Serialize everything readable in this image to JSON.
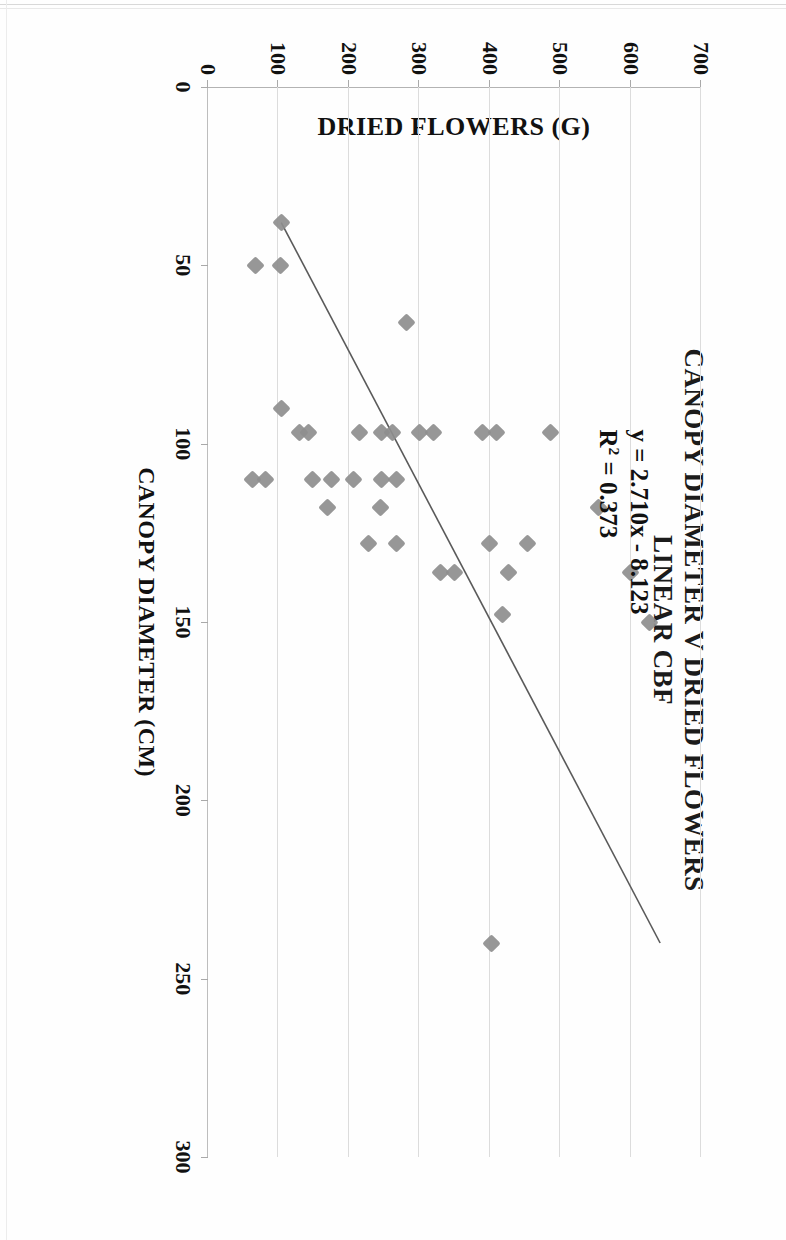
{
  "chart_data": {
    "type": "scatter",
    "title": "CANOPY DIAMETER V DRIED FLOWERS",
    "subtitle": "LINEAR CBF",
    "xlabel": "CANOPY DIAMETER (CM)",
    "ylabel": "DRIED FLOWERS (G)",
    "xlim": [
      0,
      300
    ],
    "ylim": [
      0,
      700
    ],
    "xticks": [
      "0",
      "50",
      "100",
      "150",
      "200",
      "250",
      "300"
    ],
    "yticks": [
      "0",
      "100",
      "200",
      "300",
      "400",
      "500",
      "600",
      "700"
    ],
    "xtick_values": [
      0,
      50,
      100,
      150,
      200,
      250,
      300
    ],
    "ytick_values": [
      0,
      100,
      200,
      300,
      400,
      500,
      600,
      700
    ],
    "grid": "y-gridlines-only",
    "legend": "none",
    "marker_shape": "diamond",
    "marker_color": "#8e8e8e",
    "trendline_color": "#5a5a5a",
    "annotation": {
      "equation": "y = 2.710x - 8.123",
      "r_squared": "R² = 0.373",
      "r_squared_prefix": "R",
      "r_squared_sup": "2",
      "r_squared_rest": " = 0.373",
      "slope": 2.71,
      "intercept": -8.123,
      "r2_value": 0.373
    },
    "trendline": {
      "x_start": 38,
      "y_start": 104,
      "x_end": 240,
      "y_end": 642
    },
    "points": [
      {
        "x": 38,
        "y": 105
      },
      {
        "x": 50,
        "y": 103
      },
      {
        "x": 50,
        "y": 68
      },
      {
        "x": 66,
        "y": 282
      },
      {
        "x": 90,
        "y": 105
      },
      {
        "x": 97,
        "y": 130
      },
      {
        "x": 97,
        "y": 143
      },
      {
        "x": 97,
        "y": 215
      },
      {
        "x": 97,
        "y": 247
      },
      {
        "x": 97,
        "y": 262
      },
      {
        "x": 97,
        "y": 300
      },
      {
        "x": 97,
        "y": 320
      },
      {
        "x": 97,
        "y": 390
      },
      {
        "x": 97,
        "y": 410
      },
      {
        "x": 97,
        "y": 487
      },
      {
        "x": 110,
        "y": 63
      },
      {
        "x": 110,
        "y": 82
      },
      {
        "x": 110,
        "y": 148
      },
      {
        "x": 110,
        "y": 176
      },
      {
        "x": 110,
        "y": 207
      },
      {
        "x": 110,
        "y": 246
      },
      {
        "x": 110,
        "y": 268
      },
      {
        "x": 118,
        "y": 170
      },
      {
        "x": 118,
        "y": 245
      },
      {
        "x": 118,
        "y": 555
      },
      {
        "x": 128,
        "y": 228
      },
      {
        "x": 128,
        "y": 268
      },
      {
        "x": 128,
        "y": 400
      },
      {
        "x": 128,
        "y": 454
      },
      {
        "x": 136,
        "y": 330
      },
      {
        "x": 136,
        "y": 350
      },
      {
        "x": 136,
        "y": 426
      },
      {
        "x": 136,
        "y": 600
      },
      {
        "x": 148,
        "y": 418
      },
      {
        "x": 150,
        "y": 627
      },
      {
        "x": 240,
        "y": 402
      }
    ]
  },
  "page": {
    "orientation": "rotated-90-clockwise-scan"
  }
}
